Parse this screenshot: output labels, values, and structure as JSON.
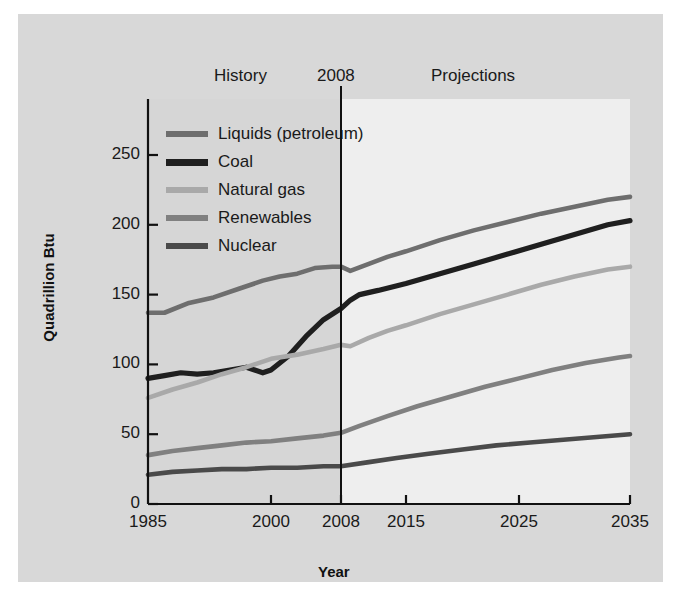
{
  "figure": {
    "background": "#d8d8d8",
    "history_bg": "#d6d6d6",
    "projection_bg": "#eeeeee"
  },
  "annotations": {
    "history": "History",
    "divider_year": "2008",
    "projections": "Projections"
  },
  "legend": {
    "position": "upper-left-inside",
    "entries": [
      {
        "label": "Liquids (petroleum)",
        "color": "#6e6e6e"
      },
      {
        "label": "Coal",
        "color": "#1f1f1f"
      },
      {
        "label": "Natural gas",
        "color": "#a9a9a9"
      },
      {
        "label": "Renewables",
        "color": "#808080"
      },
      {
        "label": "Nuclear",
        "color": "#4a4a4a"
      }
    ]
  },
  "chart_data": {
    "type": "line",
    "title": "",
    "xlabel": "Year",
    "ylabel": "Quadrillion Btu",
    "xlim": [
      1985,
      2035
    ],
    "ylim": [
      0,
      270
    ],
    "yticks": [
      0,
      50,
      100,
      150,
      200,
      250
    ],
    "xticks": [
      1985,
      2000,
      2008,
      2015,
      2025,
      2035
    ],
    "grid": false,
    "divider_x": 2008,
    "series": [
      {
        "name": "Liquids (petroleum)",
        "color": "#6e6e6e",
        "x": [
          1985,
          1987,
          1990,
          1993,
          1996,
          1999,
          2001,
          2003,
          2005,
          2007,
          2008,
          2009,
          2011,
          2013,
          2015,
          2018,
          2021,
          2024,
          2027,
          2030,
          2033,
          2035
        ],
        "values": [
          137,
          137,
          144,
          148,
          154,
          160,
          163,
          165,
          169,
          170,
          170,
          167,
          172,
          177,
          181,
          189,
          196,
          202,
          208,
          213,
          218,
          220
        ]
      },
      {
        "name": "Coal",
        "color": "#1f1f1f",
        "x": [
          1985,
          1987,
          1989,
          1991,
          1993,
          1995,
          1997,
          1999,
          2000,
          2002,
          2004,
          2006,
          2008,
          2009,
          2010,
          2012,
          2015,
          2018,
          2021,
          2024,
          2027,
          2030,
          2033,
          2035
        ],
        "values": [
          90,
          92,
          94,
          93,
          94,
          96,
          98,
          94,
          96,
          106,
          120,
          132,
          140,
          146,
          150,
          153,
          158,
          165,
          172,
          179,
          186,
          193,
          200,
          203
        ]
      },
      {
        "name": "Natural gas",
        "color": "#a9a9a9",
        "x": [
          1985,
          1988,
          1991,
          1994,
          1997,
          2000,
          2003,
          2006,
          2008,
          2009,
          2011,
          2013,
          2015,
          2018,
          2021,
          2024,
          2027,
          2030,
          2033,
          2035
        ],
        "values": [
          76,
          82,
          87,
          93,
          98,
          104,
          107,
          111,
          114,
          113,
          119,
          124,
          128,
          136,
          143,
          150,
          157,
          163,
          168,
          170
        ]
      },
      {
        "name": "Renewables",
        "color": "#808080",
        "x": [
          1985,
          1988,
          1991,
          1994,
          1997,
          2000,
          2003,
          2006,
          2008,
          2010,
          2013,
          2016,
          2019,
          2022,
          2025,
          2028,
          2031,
          2034,
          2035
        ],
        "values": [
          35,
          38,
          40,
          42,
          44,
          45,
          47,
          49,
          51,
          56,
          63,
          70,
          77,
          84,
          90,
          96,
          101,
          105,
          106
        ]
      },
      {
        "name": "Nuclear",
        "color": "#4a4a4a",
        "x": [
          1985,
          1988,
          1991,
          1994,
          1997,
          2000,
          2003,
          2006,
          2008,
          2011,
          2014,
          2017,
          2020,
          2023,
          2026,
          2029,
          2032,
          2035
        ],
        "values": [
          21,
          23,
          24,
          25,
          25,
          26,
          26,
          27,
          27,
          30,
          33,
          36,
          39,
          42,
          44,
          46,
          48,
          50
        ]
      }
    ]
  }
}
